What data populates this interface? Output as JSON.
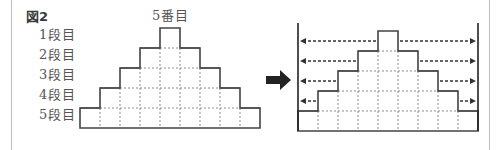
{
  "figure": {
    "label": "図2",
    "column_label": "5番目",
    "row_labels": [
      "1段目",
      "2段目",
      "3段目",
      "4段目",
      "5段目"
    ]
  },
  "left_pyramid": {
    "rows": 5,
    "cell_width": 20,
    "row_height": 20,
    "cells_per_row": [
      1,
      3,
      5,
      7,
      9
    ],
    "origin_x": 80,
    "bottom_y": 128
  },
  "transform_arrow": {
    "direction": "right",
    "color": "#222222"
  },
  "right_pyramid": {
    "rows": 5,
    "cell_width": 20,
    "row_height": 20,
    "cells_per_row": [
      1,
      3,
      5,
      7,
      9
    ],
    "origin_x": 298,
    "bottom_y": 131,
    "extension_arrows": [
      {
        "row": 1,
        "direction": "both-outward"
      },
      {
        "row": 2,
        "direction": "both-outward"
      },
      {
        "row": 3,
        "direction": "both-outward"
      },
      {
        "row": 4,
        "direction": "both-outward"
      }
    ],
    "bounding_walls": true
  },
  "colors": {
    "solid_line": "#444444",
    "dashed_line": "#8a8a8a",
    "arrow_line": "#333333",
    "frame": "#bdbdbd"
  }
}
